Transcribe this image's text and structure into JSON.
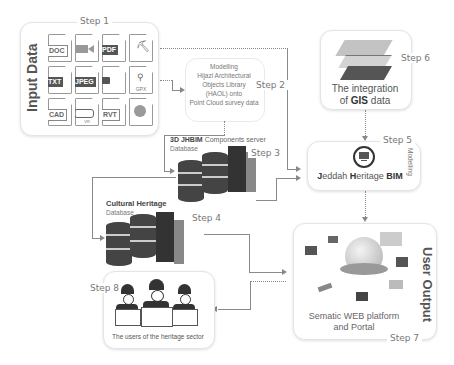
{
  "steps": {
    "s1": "Step 1",
    "s2": "Step 2",
    "s3": "Step 3",
    "s4": "Step 4",
    "s5": "Step 5",
    "s6": "Step 6",
    "s7": "Step 7",
    "s8": "Step 8"
  },
  "input_data": {
    "title": "Input Data",
    "files": [
      {
        "label": "DOC",
        "style": "outline"
      },
      {
        "label": "",
        "style": "video",
        "icon": "video-camera-icon"
      },
      {
        "label": "PDF",
        "style": "dark"
      },
      {
        "label": "",
        "style": "survey",
        "icon": "surveyor-icon"
      },
      {
        "label": "TXT",
        "style": "dark"
      },
      {
        "label": "JPEG",
        "style": "dark"
      },
      {
        "label": "",
        "style": "camera",
        "icon": "camera-icon"
      },
      {
        "label": "GPX",
        "style": "gps",
        "icon": "gps-pin-icon"
      },
      {
        "label": "CAD",
        "style": "outline"
      },
      {
        "label": "VR",
        "style": "vr",
        "icon": "vr-headset-icon"
      },
      {
        "label": "RVT",
        "style": "outline"
      },
      {
        "label": "",
        "style": "scan",
        "icon": "scan-icon"
      }
    ]
  },
  "modelling_box": {
    "text_lines": [
      "Modelling",
      "Hijazi Architectural",
      "Objects Library",
      "(HAOL) onto",
      "Point Cloud survey data"
    ]
  },
  "jhbim_db": {
    "title_bold": "3D JHBIM",
    "title_rest": " Components server",
    "subtitle": "Database"
  },
  "cultural_db": {
    "title": "Cultural Heritage",
    "subtitle": "Database"
  },
  "gis_box": {
    "line1": "The integration",
    "line2_pre": "of ",
    "line2_bold": "GIS",
    "line2_post": " data"
  },
  "bim_box": {
    "j": "J",
    "eddah": "eddah ",
    "h": "H",
    "eritage": "eritage ",
    "bim": "BIM",
    "side_label": "Modelling"
  },
  "output_box": {
    "title": "User Output",
    "line1": "Sematic WEB platform",
    "line2": "and Portal"
  },
  "users_box": {
    "caption": "The users of the heritage sector"
  }
}
